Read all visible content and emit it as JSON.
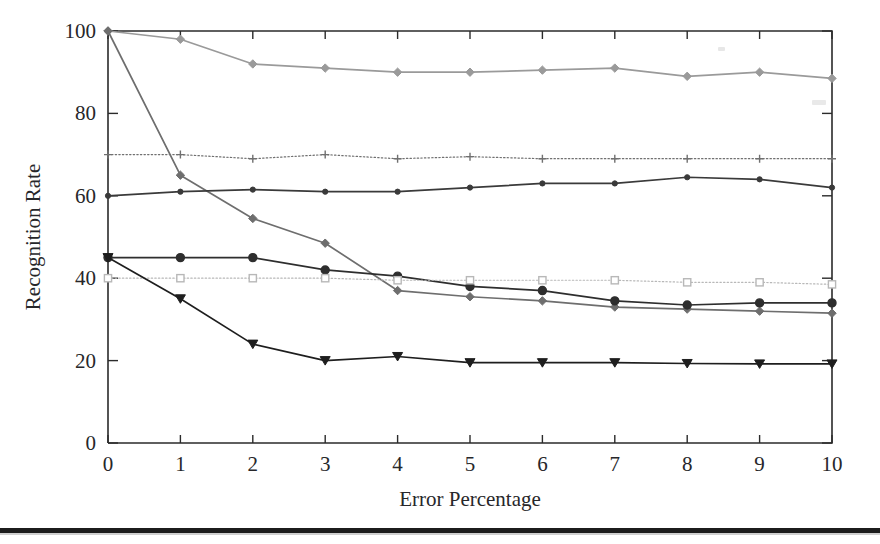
{
  "figure": {
    "title": "",
    "xlabel": "Error Percentage",
    "ylabel": "Recognition Rate"
  },
  "axes": {
    "x_ticks": [
      "0",
      "1",
      "2",
      "3",
      "4",
      "5",
      "6",
      "7",
      "8",
      "9",
      "10"
    ],
    "y_ticks": [
      "0",
      "20",
      "40",
      "60",
      "80",
      "100"
    ],
    "x_min": 0,
    "x_max": 10,
    "y_min": 0,
    "y_max": 100
  },
  "colors": {
    "axis": "#2b2b2b",
    "text": "#27272a",
    "series_1": "#9a9a9a",
    "series_2": "#6e6e6e",
    "series_3": "#707070",
    "series_4": "#3a3a3a",
    "series_5": "#2e2e2e",
    "series_6": "#b8b8b8",
    "series_7": "#1e1e1e",
    "page_rule": "#1c1c1c"
  },
  "chart_data": {
    "type": "line",
    "title": "",
    "xlabel": "Error Percentage",
    "ylabel": "Recognition Rate",
    "xlim": [
      0,
      10
    ],
    "ylim": [
      0,
      100
    ],
    "grid": false,
    "legend": "none",
    "x": [
      0,
      1,
      2,
      3,
      4,
      5,
      6,
      7,
      8,
      9,
      10
    ],
    "series": [
      {
        "name": "series-1-top",
        "marker": "diamond",
        "color": "#9a9a9a",
        "linestyle": "solid",
        "values": [
          100,
          98,
          92,
          91,
          90,
          90,
          90.5,
          91,
          89,
          90,
          88.5
        ]
      },
      {
        "name": "series-2-steep-decline",
        "marker": "diamond",
        "color": "#6e6e6e",
        "linestyle": "solid",
        "values": [
          100,
          65,
          54.5,
          48.5,
          37,
          35.5,
          34.5,
          33,
          32.5,
          32,
          31.5
        ]
      },
      {
        "name": "series-3-dotted-plus",
        "marker": "plus",
        "color": "#707070",
        "linestyle": "dotted",
        "values": [
          70,
          70,
          69,
          70,
          69,
          69.5,
          69,
          69,
          69,
          69,
          69
        ]
      },
      {
        "name": "series-4-mid-circle",
        "marker": "circle-small",
        "color": "#3a3a3a",
        "linestyle": "solid",
        "values": [
          60,
          61,
          61.5,
          61,
          61,
          62,
          63,
          63,
          64.5,
          64,
          62
        ]
      },
      {
        "name": "series-5-circle-decline",
        "marker": "circle",
        "color": "#2e2e2e",
        "linestyle": "solid",
        "values": [
          45,
          45,
          45,
          42,
          40.5,
          38,
          37,
          34.5,
          33.5,
          34,
          34
        ]
      },
      {
        "name": "series-6-square-flat",
        "marker": "square",
        "color": "#b8b8b8",
        "linestyle": "dotted",
        "values": [
          40,
          40,
          40,
          40,
          39.5,
          39.5,
          39.5,
          39.5,
          39,
          39,
          38.5
        ]
      },
      {
        "name": "series-7-triangle-low",
        "marker": "triangle-down",
        "color": "#1e1e1e",
        "linestyle": "solid",
        "values": [
          45,
          35,
          24,
          20,
          21,
          19.5,
          19.5,
          19.5,
          19.3,
          19.2,
          19.2
        ]
      }
    ]
  }
}
